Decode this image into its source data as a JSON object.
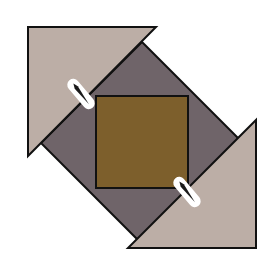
{
  "diagram": {
    "colors": {
      "background": "#ffffff",
      "light_triangle": "#bcaea6",
      "grey_square": "#6f6469",
      "center_square": "#7d5f2c",
      "outline": "#111111",
      "marker_fill": "#ffffff",
      "marker_needle": "#1a1a1a"
    },
    "shapes": {
      "grey_diamond": "142,42 243,143 142,244 41,143",
      "center_square": {
        "x": 96,
        "y": 96,
        "w": 92,
        "h": 92
      },
      "triangle_top_left": "28,27 156,27 28,156",
      "triangle_bottom_right": "256,120 256,248 128,248"
    },
    "markers": [
      {
        "name": "seam-marker-top-left",
        "cx": 81,
        "cy": 94,
        "angle": 50
      },
      {
        "name": "seam-marker-bottom-right",
        "cx": 187,
        "cy": 192,
        "angle": 50
      }
    ]
  }
}
